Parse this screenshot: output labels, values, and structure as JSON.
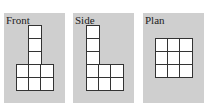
{
  "views": [
    {
      "name": "front",
      "label": "Front",
      "left": 4,
      "cells": [
        [
          24,
          12
        ],
        [
          24,
          25
        ],
        [
          24,
          38
        ],
        [
          12,
          51
        ],
        [
          24,
          51
        ],
        [
          36,
          51
        ],
        [
          12,
          64
        ],
        [
          24,
          64
        ],
        [
          36,
          64
        ]
      ]
    },
    {
      "name": "side",
      "label": "Side",
      "left": 73,
      "cells": [
        [
          13,
          12
        ],
        [
          13,
          25
        ],
        [
          13,
          38
        ],
        [
          13,
          51
        ],
        [
          25,
          51
        ],
        [
          37,
          51
        ],
        [
          13,
          64
        ],
        [
          25,
          64
        ],
        [
          37,
          64
        ]
      ]
    },
    {
      "name": "plan",
      "label": "Plan",
      "left": 143,
      "cells": [
        [
          12,
          25
        ],
        [
          24,
          25
        ],
        [
          36,
          25
        ],
        [
          12,
          38
        ],
        [
          24,
          38
        ],
        [
          36,
          38
        ],
        [
          12,
          51
        ],
        [
          24,
          51
        ],
        [
          36,
          51
        ]
      ]
    }
  ]
}
